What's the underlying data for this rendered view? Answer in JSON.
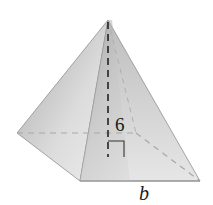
{
  "diagram": {
    "type": "square-pyramid",
    "labels": {
      "height": "6",
      "base_edge": "b"
    },
    "colors": {
      "left_face_light": "#e2e2e2",
      "left_face_dark": "#a6a6a6",
      "front_face_light": "#cfcfcf",
      "front_face_dark": "#8f8f8f",
      "right_face_light": "#dcdcdc",
      "right_face_dark": "#b4b4b4",
      "edge": "#8a8a8a",
      "hidden_edge": "#a8a8a8",
      "height_line": "#222222"
    }
  }
}
